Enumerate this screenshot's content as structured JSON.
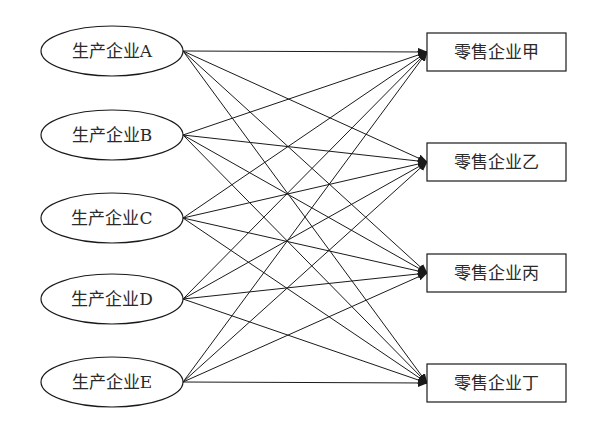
{
  "diagram": {
    "type": "bipartite-flow",
    "producers": [
      {
        "id": "A",
        "label": "生产企业A",
        "cy": 51
      },
      {
        "id": "B",
        "label": "生产企业B",
        "cy": 135
      },
      {
        "id": "C",
        "label": "生产企业C",
        "cy": 218
      },
      {
        "id": "D",
        "label": "生产企业D",
        "cy": 299
      },
      {
        "id": "E",
        "label": "生产企业E",
        "cy": 382
      }
    ],
    "retailers": [
      {
        "id": "jia",
        "label": "零售企业甲",
        "cy": 52
      },
      {
        "id": "yi",
        "label": "零售企业乙",
        "cy": 162
      },
      {
        "id": "bing",
        "label": "零售企业丙",
        "cy": 273
      },
      {
        "id": "ding",
        "label": "零售企业丁",
        "cy": 383
      }
    ],
    "edges": "all-to-all (each producer → each retailer, 20 arrows)",
    "colors": {
      "stroke": "#1a1a1a",
      "text": "#2a2a2a",
      "background": "#ffffff"
    }
  }
}
